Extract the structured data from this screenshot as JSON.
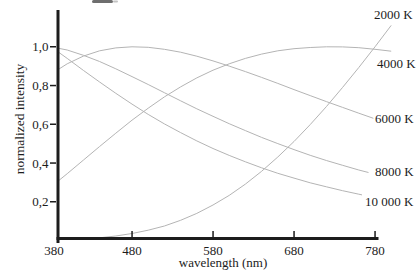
{
  "figure": {
    "background_color": "#ffffff",
    "axis_color": "#1c1c1c",
    "curve_color": "#b4b4b4"
  },
  "chart_data": {
    "type": "line",
    "title": "",
    "xlabel": "wavelength (nm)",
    "ylabel": "normalized intensity",
    "xlim": [
      380,
      800
    ],
    "ylim": [
      0,
      1.16
    ],
    "grid": false,
    "legend_position": "right-of-curve-ends",
    "xticks": [
      380,
      480,
      580,
      680,
      780
    ],
    "ytick_labels": [
      "1,0",
      "0,8",
      "0,6",
      "0,4",
      "0,2"
    ],
    "ytick_values": [
      1.0,
      0.8,
      0.6,
      0.4,
      0.2
    ],
    "x": [
      380,
      400,
      420,
      440,
      460,
      480,
      500,
      520,
      540,
      560,
      580,
      600,
      620,
      640,
      660,
      680,
      700,
      720,
      740,
      760,
      780,
      800
    ],
    "series": [
      {
        "name": "2000 K",
        "temperature_K": 2000,
        "values": [
          0.002,
          0.004,
          0.008,
          0.014,
          0.023,
          0.036,
          0.053,
          0.075,
          0.104,
          0.14,
          0.183,
          0.233,
          0.291,
          0.357,
          0.431,
          0.511,
          0.598,
          0.691,
          0.79,
          0.893,
          1.0,
          1.11
        ]
      },
      {
        "name": "4000 K",
        "temperature_K": 4000,
        "values": [
          0.277,
          0.345,
          0.415,
          0.485,
          0.554,
          0.621,
          0.683,
          0.741,
          0.793,
          0.839,
          0.879,
          0.912,
          0.94,
          0.962,
          0.979,
          0.99,
          0.996,
          1.0,
          0.999,
          0.995,
          0.987,
          0.977
        ]
      },
      {
        "name": "6000 K",
        "temperature_K": 6000,
        "values": [
          0.859,
          0.912,
          0.952,
          0.979,
          0.994,
          1.0,
          0.997,
          0.987,
          0.972,
          0.951,
          0.927,
          0.9,
          0.872,
          0.842,
          0.811,
          0.779,
          0.748,
          0.717,
          0.687,
          0.657,
          0.628,
          0.6
        ]
      },
      {
        "name": "8000 K",
        "temperature_K": 8000,
        "values": [
          1.0,
          0.983,
          0.956,
          0.924,
          0.886,
          0.846,
          0.805,
          0.763,
          0.721,
          0.68,
          0.641,
          0.603,
          0.567,
          0.532,
          0.5,
          0.469,
          0.44,
          0.413,
          0.388,
          0.364,
          0.342,
          0.322
        ]
      },
      {
        "name": "10 000 K",
        "temperature_K": 10000,
        "values": [
          1.0,
          0.94,
          0.878,
          0.818,
          0.76,
          0.704,
          0.651,
          0.602,
          0.557,
          0.514,
          0.475,
          0.439,
          0.406,
          0.375,
          0.347,
          0.322,
          0.298,
          0.277,
          0.257,
          0.239,
          0.222,
          0.207
        ]
      }
    ]
  }
}
